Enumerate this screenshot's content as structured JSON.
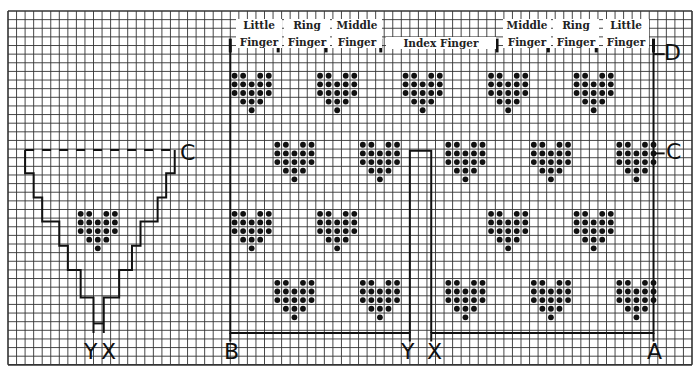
{
  "diagram": {
    "type": "knitting-chart",
    "grid": {
      "cols": 80,
      "rows": 41,
      "cell_w": 8.55,
      "cell_h": 8.63,
      "origin_x": 8,
      "origin_y": 11,
      "color": "#333333"
    },
    "finger_labels": [
      {
        "line1": "Little",
        "line2": "Finger",
        "x": 236,
        "w": 46
      },
      {
        "line1": "Ring",
        "line2": "Finger",
        "x": 284,
        "w": 46
      },
      {
        "line1": "Middle",
        "line2": "Finger",
        "x": 332,
        "w": 50
      },
      {
        "line1": "",
        "line2": "Index Finger",
        "x": 386,
        "w": 110
      },
      {
        "line1": "Middle",
        "line2": "Finger",
        "x": 503,
        "w": 48
      },
      {
        "line1": "Ring",
        "line2": "Finger",
        "x": 553,
        "w": 46
      },
      {
        "line1": "Little",
        "line2": "Finger",
        "x": 603,
        "w": 46
      }
    ],
    "point_labels": {
      "D_right": "D",
      "C_right": "C",
      "C_left": "C",
      "A": "A",
      "B": "B",
      "Y_main": "Y",
      "X_main": "X",
      "Y_thumb": "Y",
      "X_thumb": "X"
    },
    "motif": {
      "name": "heart",
      "dot_color": "#111111",
      "pattern": [
        [
          1,
          1,
          0,
          1,
          1
        ],
        [
          1,
          1,
          1,
          1,
          1
        ],
        [
          1,
          1,
          1,
          1,
          1
        ],
        [
          0,
          1,
          1,
          1,
          0
        ],
        [
          0,
          0,
          1,
          0,
          0
        ]
      ]
    },
    "hearts_main": [
      [
        26,
        7
      ],
      [
        36,
        7
      ],
      [
        46,
        7
      ],
      [
        56,
        7
      ],
      [
        66,
        7
      ],
      [
        31,
        15
      ],
      [
        41,
        15
      ],
      [
        51,
        15
      ],
      [
        61,
        15
      ],
      [
        71,
        15
      ],
      [
        26,
        23
      ],
      [
        36,
        23
      ],
      [
        56,
        23
      ],
      [
        66,
        23
      ],
      [
        31,
        31
      ],
      [
        41,
        31
      ],
      [
        51,
        31
      ],
      [
        61,
        31
      ],
      [
        71,
        31
      ]
    ],
    "hearts_thumb": [
      [
        8,
        23
      ]
    ]
  }
}
